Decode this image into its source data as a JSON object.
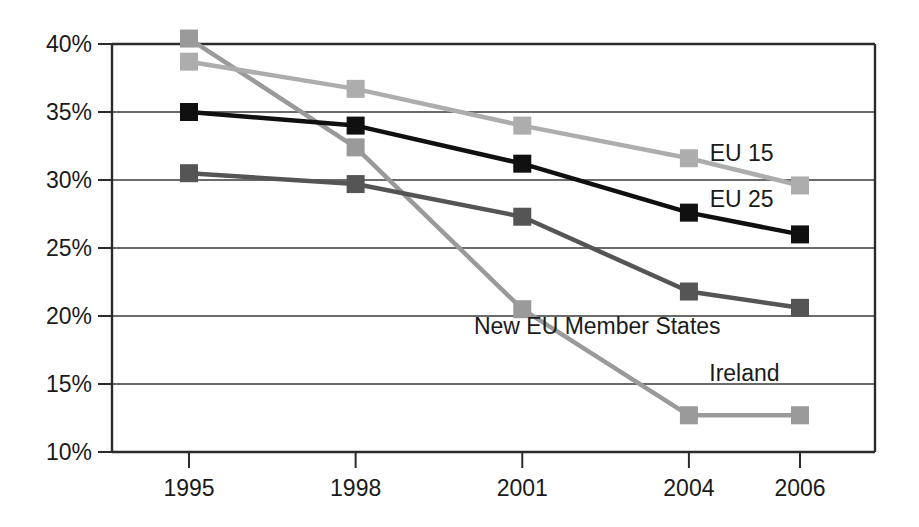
{
  "chart_data": {
    "type": "line",
    "title": "",
    "subtitle": "",
    "xlabel": "",
    "ylabel": "",
    "categories": [
      "1995",
      "1998",
      "2001",
      "2004",
      "2006"
    ],
    "x": [
      1995,
      1998,
      2001,
      2004,
      2006
    ],
    "ylim": [
      10,
      40
    ],
    "xlim": [
      1995,
      2006
    ],
    "ytick_labels": [
      "40%",
      "35%",
      "30%",
      "25%",
      "20%",
      "15%",
      "10%"
    ],
    "ytick_values": [
      40,
      35,
      30,
      25,
      20,
      15,
      10
    ],
    "xtick_labels": [
      "1995",
      "1998",
      "2001",
      "2004",
      "2006"
    ],
    "grid": "horizontal",
    "legend_position": "inline-right",
    "value_suffix": "%",
    "series": [
      {
        "name": "Ireland",
        "label": "Ireland",
        "color": "#9a9a9a",
        "marker": "square",
        "values": [
          40.4,
          32.4,
          20.5,
          12.7,
          12.7
        ],
        "label_x": 2005.0,
        "label_y": 15.2
      },
      {
        "name": "EU 15",
        "label": "EU 15",
        "color": "#adadad",
        "marker": "square",
        "values": [
          38.7,
          36.7,
          34.0,
          31.6,
          29.6
        ],
        "label_x": 2004.95,
        "label_y": 31.4
      },
      {
        "name": "EU 25",
        "label": "EU 25",
        "color": "#101010",
        "marker": "square",
        "values": [
          35.0,
          34.0,
          31.2,
          27.6,
          26.0
        ],
        "label_x": 2004.95,
        "label_y": 28.0
      },
      {
        "name": "New EU Member States",
        "label": "New EU Member States",
        "color": "#555555",
        "marker": "square",
        "values": [
          30.5,
          29.7,
          27.3,
          21.8,
          20.6
        ],
        "label_x": 2002.35,
        "label_y": 18.7
      }
    ]
  }
}
